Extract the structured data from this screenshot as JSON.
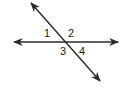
{
  "diagram": {
    "line_color": "#2a2a2a",
    "background": "#ffffff",
    "lines": [
      {
        "name": "horizontal-line",
        "x1": 14,
        "y1": 42,
        "x2": 118,
        "y2": 42
      },
      {
        "name": "transversal-line",
        "x1": 31,
        "y1": 3,
        "x2": 100,
        "y2": 81
      }
    ],
    "angle_labels": [
      {
        "text": "1",
        "x": 44,
        "y": 37
      },
      {
        "text": "2",
        "x": 68,
        "y": 37
      },
      {
        "text": "3",
        "x": 60,
        "y": 55
      },
      {
        "text": "4",
        "x": 79,
        "y": 55
      }
    ]
  }
}
